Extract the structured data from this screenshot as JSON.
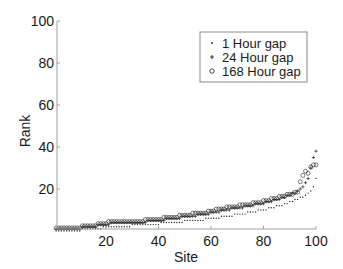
{
  "chart_data": {
    "type": "scatter",
    "title": "",
    "xlabel": "Site",
    "ylabel": "Rank",
    "xlim": [
      1,
      100
    ],
    "ylim": [
      1,
      100
    ],
    "xticks": [
      20,
      40,
      60,
      80,
      100
    ],
    "yticks": [
      20,
      40,
      60,
      80,
      100
    ],
    "grid": false,
    "legend_position": "upper right (inside)",
    "series": [
      {
        "name": "1 Hour gap",
        "marker": "point",
        "x": [
          1,
          2,
          3,
          4,
          5,
          6,
          7,
          8,
          9,
          10,
          11,
          12,
          13,
          14,
          15,
          16,
          17,
          18,
          19,
          20,
          21,
          22,
          23,
          24,
          25,
          26,
          27,
          28,
          29,
          30,
          31,
          32,
          33,
          34,
          35,
          36,
          37,
          38,
          39,
          40,
          41,
          42,
          43,
          44,
          45,
          46,
          47,
          48,
          49,
          50,
          51,
          52,
          53,
          54,
          55,
          56,
          57,
          58,
          59,
          60,
          61,
          62,
          63,
          64,
          65,
          66,
          67,
          68,
          69,
          70,
          71,
          72,
          73,
          74,
          75,
          76,
          77,
          78,
          79,
          80,
          81,
          82,
          83,
          84,
          85,
          86,
          87,
          88,
          89,
          90,
          91,
          92,
          93,
          94,
          95,
          96,
          97,
          98,
          99,
          100
        ],
        "values": [
          1,
          1,
          1,
          1,
          1,
          1,
          1,
          1,
          1,
          1,
          2,
          2,
          2,
          2,
          2,
          2,
          2,
          2,
          3,
          3,
          3,
          3,
          3,
          3,
          3,
          3,
          3,
          3,
          3,
          4,
          4,
          4,
          4,
          4,
          4,
          4,
          4,
          4,
          4,
          4,
          5,
          5,
          5,
          5,
          5,
          5,
          5,
          5,
          5,
          6,
          6,
          6,
          6,
          6,
          6,
          6,
          6,
          7,
          7,
          7,
          7,
          7,
          7,
          8,
          8,
          8,
          8,
          8,
          9,
          9,
          9,
          9,
          9,
          10,
          10,
          10,
          10,
          11,
          11,
          11,
          11,
          12,
          12,
          12,
          13,
          13,
          13,
          14,
          14,
          15,
          15,
          16,
          16,
          17,
          17,
          18,
          19,
          20,
          22,
          26
        ]
      },
      {
        "name": "24 Hour gap",
        "marker": "plus",
        "x": [
          1,
          2,
          3,
          4,
          5,
          6,
          7,
          8,
          9,
          10,
          11,
          12,
          13,
          14,
          15,
          16,
          17,
          18,
          19,
          20,
          21,
          22,
          23,
          24,
          25,
          26,
          27,
          28,
          29,
          30,
          31,
          32,
          33,
          34,
          35,
          36,
          37,
          38,
          39,
          40,
          41,
          42,
          43,
          44,
          45,
          46,
          47,
          48,
          49,
          50,
          51,
          52,
          53,
          54,
          55,
          56,
          57,
          58,
          59,
          60,
          61,
          62,
          63,
          64,
          65,
          66,
          67,
          68,
          69,
          70,
          71,
          72,
          73,
          74,
          75,
          76,
          77,
          78,
          79,
          80,
          81,
          82,
          83,
          84,
          85,
          86,
          87,
          88,
          89,
          90,
          91,
          92,
          93,
          94,
          95,
          96,
          97,
          98,
          99,
          100
        ],
        "values": [
          1,
          1,
          1,
          1,
          1,
          1,
          1,
          1,
          1,
          1,
          2,
          2,
          2,
          2,
          2,
          2,
          3,
          3,
          3,
          3,
          3,
          4,
          4,
          4,
          4,
          4,
          4,
          4,
          4,
          4,
          4,
          4,
          4,
          4,
          4,
          5,
          5,
          5,
          5,
          5,
          5,
          5,
          6,
          6,
          6,
          6,
          6,
          6,
          7,
          7,
          7,
          7,
          7,
          7,
          8,
          8,
          8,
          8,
          8,
          9,
          9,
          9,
          9,
          10,
          10,
          10,
          10,
          11,
          11,
          11,
          11,
          11,
          12,
          12,
          12,
          12,
          13,
          13,
          13,
          13,
          14,
          14,
          14,
          15,
          15,
          15,
          16,
          16,
          17,
          17,
          18,
          18,
          19,
          20,
          21,
          23,
          25,
          30,
          35,
          38
        ]
      },
      {
        "name": "168 Hour gap",
        "marker": "circle",
        "x": [
          1,
          2,
          3,
          4,
          5,
          6,
          7,
          8,
          9,
          10,
          11,
          12,
          13,
          14,
          15,
          16,
          17,
          18,
          19,
          20,
          21,
          22,
          23,
          24,
          25,
          26,
          27,
          28,
          29,
          30,
          31,
          32,
          33,
          34,
          35,
          36,
          37,
          38,
          39,
          40,
          41,
          42,
          43,
          44,
          45,
          46,
          47,
          48,
          49,
          50,
          51,
          52,
          53,
          54,
          55,
          56,
          57,
          58,
          59,
          60,
          61,
          62,
          63,
          64,
          65,
          66,
          67,
          68,
          69,
          70,
          71,
          72,
          73,
          74,
          75,
          76,
          77,
          78,
          79,
          80,
          81,
          82,
          83,
          84,
          85,
          86,
          87,
          88,
          89,
          90,
          91,
          92,
          93,
          94,
          95,
          96,
          97,
          98,
          99,
          100
        ],
        "values": [
          1,
          1,
          1,
          1,
          1,
          1,
          1,
          1,
          1,
          1,
          2,
          2,
          2,
          2,
          2,
          2,
          3,
          3,
          3,
          3,
          4,
          4,
          4,
          4,
          4,
          4,
          4,
          4,
          4,
          4,
          4,
          4,
          4,
          4,
          5,
          5,
          5,
          5,
          5,
          5,
          5,
          6,
          6,
          6,
          6,
          6,
          6,
          7,
          7,
          7,
          7,
          7,
          8,
          8,
          8,
          8,
          8,
          8,
          9,
          9,
          9,
          10,
          10,
          10,
          10,
          11,
          11,
          11,
          11,
          11,
          12,
          12,
          12,
          12,
          12,
          13,
          13,
          13,
          13,
          14,
          14,
          14,
          15,
          15,
          15,
          16,
          16,
          16,
          17,
          17,
          17,
          18,
          18,
          23,
          26,
          28,
          27,
          30,
          31,
          31
        ]
      }
    ]
  },
  "legend": {
    "items": [
      {
        "label": "1 Hour gap",
        "marker": "point"
      },
      {
        "label": "24 Hour gap",
        "marker": "plus"
      },
      {
        "label": "168 Hour gap",
        "marker": "circle"
      }
    ]
  },
  "axes": {
    "xlabel": "Site",
    "ylabel": "Rank",
    "xtick_labels": [
      "20",
      "40",
      "60",
      "80",
      "100"
    ],
    "ytick_labels": [
      "20",
      "40",
      "60",
      "80",
      "100"
    ]
  },
  "colors": {
    "axis": "#a0a0a0",
    "marker": "#222222",
    "text": "#1a1a1a",
    "background": "#ffffff"
  }
}
